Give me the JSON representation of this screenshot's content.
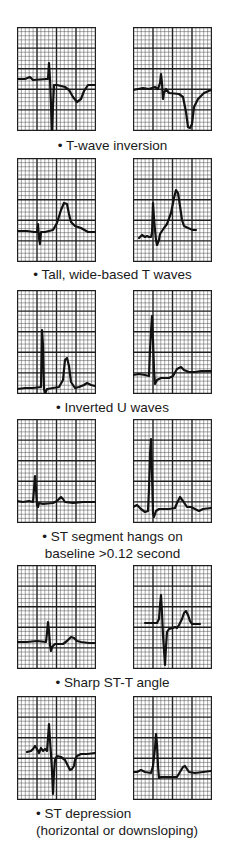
{
  "figure": {
    "rows": [
      {
        "caption": [
          "• T-wave inversion"
        ],
        "caption_align": "center",
        "caption_top": 137,
        "panel_top": 27,
        "left_trace": "0,52 8,52 13,50 16,53 29,52 31,52 32,36 33,52 34,78 35,115 36,78 37,58 40,58 48,60 52,63 56,70 60,75 64,72 67,64 71,58 78,58",
        "right_trace": "0,63 10,61 16,62 22,60 25,62 27,56 28,47 29,56 30,72 31,66 33,62 36,66 46,67 50,70 53,85 55,100 57,101 59,97 61,80 65,72 71,66 78,63"
      },
      {
        "caption": [
          "• Tall, wide-based T waves"
        ],
        "caption_align": "center",
        "caption_top": 266,
        "panel_top": 158,
        "left_trace": "0,73 10,73 17,74 20,74 21,66 22,80 23,86 24,74 28,74 36,72 40,65 44,52 47,45 50,46 52,56 54,64 58,68 64,70 71,74 78,74",
        "right_trace": "6,80 9,77 12,79 14,78 16,79 18,79 19,75 20,45 21,60 22,72 23,82 24,87 26,82 27,76 29,73 31,70 34,66 38,55 41,40 43,32 45,35 47,48 49,62 51,68 55,70 60,72 63,72"
      },
      {
        "caption": [
          "• Inverted U waves"
        ],
        "caption_align": "center",
        "caption_top": 399,
        "panel_top": 290,
        "left_trace": "0,99 8,98 16,98 24,97 25,40 26,55 27,99 28,104 30,99 36,98 42,97 46,90 48,70 50,68 52,76 54,92 58,98 62,97 67,95 70,93 74,95 78,96",
        "right_trace": "0,85 6,84 12,85 16,86 17,60 18,42 19,26 20,50 21,80 22,94 24,90 28,88 36,88 40,86 44,79 48,77 51,80 56,82 62,82 68,81 78,81"
      },
      {
        "caption": [
          "• ST segment hangs on",
          "baseline >0.12 second"
        ],
        "caption_align": "center",
        "caption_top": 528,
        "panel_top": 419,
        "left_trace": "0,82 6,83 12,82 16,83 17,70 18,57 19,70 20,86 21,88 22,84 26,85 36,84 40,82 44,78 46,80 48,83 56,84 66,83 78,83",
        "right_trace": "0,88 4,86 8,90 12,93 15,92 16,70 17,35 18,20 19,55 20,94 21,98 23,92 26,90 36,90 42,89 44,84 47,78 50,82 54,88 58,88 62,90 66,92 70,90 78,89"
      },
      {
        "caption": [
          "• Sharp ST-T angle"
        ],
        "caption_align": "center",
        "caption_top": 674,
        "panel_top": 565,
        "left_trace": "0,77 10,77 20,76 29,77 30,68 31,57 32,66 33,80 34,86 35,82 38,79 46,79 50,76 54,72 57,73 60,76 64,77 72,78 78,78",
        "right_trace": "12,58 20,58 24,58 26,54 27,40 28,30 29,48 30,70 31,85 32,100 33,82 34,67 36,64 40,63 42,62 44,63 46,60 49,54 51,48 53,46 55,50 57,56 59,59 62,59 67,59"
      },
      {
        "caption": [
          "• ST depression",
          "(horizontal or downsloping)"
        ],
        "caption_align": "left",
        "caption_top": 805,
        "panel_top": 696,
        "left_trace": "10,56 14,55 16,53 18,50 20,53 22,57 24,52 26,55 28,53 30,55 31,42 32,28 33,44 34,58 35,75 36,98 37,76 38,64 40,60 44,61 48,64 51,70 53,74 55,73 57,70 58,64 60,60 64,58 70,58 78,57",
        "right_trace": "0,76 4,76 8,74 12,76 18,77 20,70 22,52 23,38 24,48 25,70 26,82 28,81 36,81 44,81 47,76 50,71 52,70 54,73 56,76 62,77 70,76 78,75"
      }
    ],
    "columns": {
      "left_x": 17,
      "right_x": 133
    },
    "panel_size": {
      "width": 79,
      "height": 104
    },
    "grid": {
      "major_cols": 4,
      "major_rows": 5,
      "minor_per_major": 5
    },
    "colors": {
      "minor_grid": "#3c3c3c",
      "major_grid": "#1e1e1e",
      "trace": "#111111",
      "paper": "#ffffff",
      "text": "#1a1a1a"
    }
  }
}
